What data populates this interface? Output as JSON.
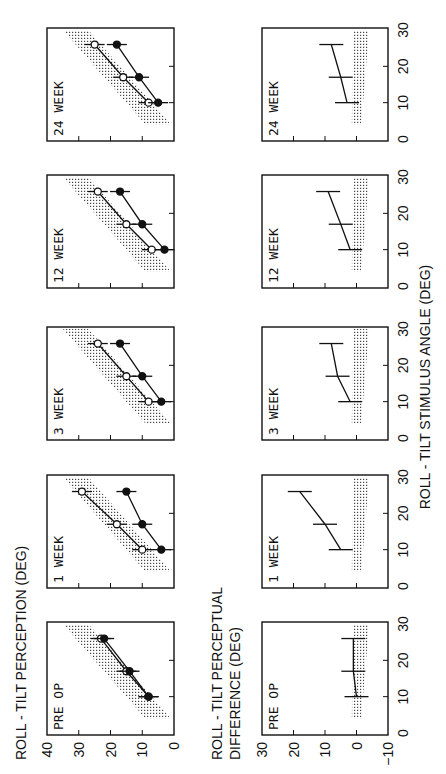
{
  "chart_data": [
    {
      "type": "line",
      "title": "ROLL - TILT PERCEPTION (DEG)",
      "xlabel": "ROLL - TILT STIMULUS ANGLE (DEG)",
      "ylabel": "ROLL - TILT PERCEPTION (DEG)",
      "xlim": [
        0,
        30
      ],
      "ylim": [
        0,
        40
      ],
      "xticks": [
        0,
        10,
        20,
        30
      ],
      "yticks": [
        0,
        10,
        20,
        30,
        40
      ],
      "x": [
        10,
        17,
        26
      ],
      "panels": [
        {
          "label": "PRE OP",
          "series": [
            {
              "name": "open circles",
              "values": [
                8,
                15,
                23
              ]
            },
            {
              "name": "filled circles",
              "values": [
                8,
                14,
                22
              ]
            }
          ],
          "normal_band": true
        },
        {
          "label": "1 WEEK",
          "series": [
            {
              "name": "open circles",
              "values": [
                10,
                18,
                29
              ]
            },
            {
              "name": "filled circles",
              "values": [
                4,
                10,
                15
              ]
            }
          ],
          "normal_band": true
        },
        {
          "label": "3 WEEK",
          "series": [
            {
              "name": "open circles",
              "values": [
                8,
                15,
                24
              ]
            },
            {
              "name": "filled circles",
              "values": [
                4,
                10,
                17
              ]
            }
          ],
          "normal_band": true
        },
        {
          "label": "12 WEEK",
          "series": [
            {
              "name": "open circles",
              "values": [
                7,
                15,
                24
              ]
            },
            {
              "name": "filled circles",
              "values": [
                3,
                10,
                17
              ]
            }
          ],
          "normal_band": true
        },
        {
          "label": "24 WEEK",
          "series": [
            {
              "name": "open circles",
              "values": [
                8,
                16,
                25
              ]
            },
            {
              "name": "filled circles",
              "values": [
                5,
                11,
                18
              ]
            }
          ],
          "normal_band": true
        }
      ]
    },
    {
      "type": "line",
      "title": "ROLL - TILT PERCEPTUAL DIFFERENCE (DEG)",
      "xlabel": "ROLL - TILT STIMULUS ANGLE (DEG)",
      "ylabel": "ROLL - TILT PERCEPTUAL DIFFERENCE (DEG)",
      "xlim": [
        0,
        30
      ],
      "ylim": [
        -10,
        30
      ],
      "xticks": [
        0,
        10,
        20,
        30
      ],
      "yticks": [
        -10,
        0,
        10,
        20,
        30
      ],
      "x": [
        10,
        17,
        26
      ],
      "panels": [
        {
          "label": "PRE OP",
          "values": [
            0,
            1,
            1
          ]
        },
        {
          "label": "1 WEEK",
          "values": [
            5,
            10,
            18
          ]
        },
        {
          "label": "3 WEEK",
          "values": [
            2,
            6,
            8
          ]
        },
        {
          "label": "12 WEEK",
          "values": [
            2,
            5,
            9
          ]
        },
        {
          "label": "24 WEEK",
          "values": [
            3,
            5,
            8
          ]
        }
      ]
    }
  ],
  "labels": {
    "top_title": "ROLL - TILT PERCEPTION   (DEG)",
    "bottom_title_line1": "ROLL - TILT PERCEPTUAL",
    "bottom_title_line2": "DIFFERENCE  (DEG)",
    "x_axis_title": "ROLL - TILT STIMULUS ANGLE (DEG)"
  },
  "panel_labels": [
    "PRE  OP",
    "1  WEEK",
    "3  WEEK",
    "12  WEEK",
    "24  WEEK"
  ],
  "top_y_ticks": [
    "40",
    "30",
    "20",
    "10",
    "0"
  ],
  "bottom_y_ticks": [
    "30",
    "20",
    "10",
    "0",
    "−10"
  ],
  "x_ticks": [
    "0",
    "10",
    "20",
    "30"
  ]
}
